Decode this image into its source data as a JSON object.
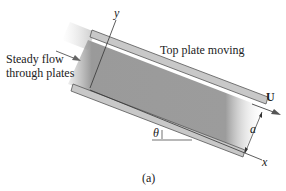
{
  "figure": {
    "caption": "(a)",
    "labels": {
      "inflow": [
        "Steady flow",
        "through plates"
      ],
      "top_plate": "Top plate moving",
      "velocity": "U",
      "gap": "a",
      "angle": "θ",
      "x_axis": "x",
      "y_axis": "y"
    },
    "colors": {
      "fluid": "#9a9a9a",
      "plate_fill": "#c8c8c8",
      "plate_edge": "#555555",
      "line": "#333333"
    }
  }
}
